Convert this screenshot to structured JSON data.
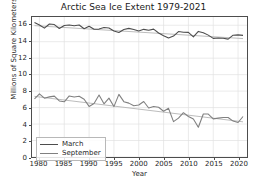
{
  "chart_data": {
    "type": "line",
    "title": "Arctic Sea Ice Extent 1979-2021",
    "xlabel": "Year",
    "ylabel": "Millions of Square Kilometers",
    "xlim": [
      1978.5,
      2021.8
    ],
    "ylim": [
      0,
      17.0
    ],
    "xticks": [
      1980,
      1985,
      1990,
      1995,
      2000,
      2005,
      2010,
      2015,
      2020
    ],
    "yticks": [
      0,
      2,
      4,
      6,
      8,
      10,
      12,
      14,
      16
    ],
    "grid": true,
    "legend_position": "lower left",
    "colors": {
      "march": "#4d4d4d",
      "september": "#808080",
      "trend": "#b3b3b3",
      "grid": "#e0e0e0",
      "axis": "#4d4d4d",
      "text": "#262626"
    },
    "x": [
      1979,
      1980,
      1981,
      1982,
      1983,
      1984,
      1985,
      1986,
      1987,
      1988,
      1989,
      1990,
      1991,
      1992,
      1993,
      1994,
      1995,
      1996,
      1997,
      1998,
      1999,
      2000,
      2001,
      2002,
      2003,
      2004,
      2005,
      2006,
      2007,
      2008,
      2009,
      2010,
      2011,
      2012,
      2013,
      2014,
      2015,
      2016,
      2017,
      2018,
      2019,
      2020,
      2021
    ],
    "series": [
      {
        "name": "March",
        "color": "#4d4d4d",
        "values": [
          16.34,
          16.03,
          15.65,
          16.15,
          16.08,
          15.6,
          15.96,
          16.03,
          15.94,
          16.03,
          15.57,
          15.88,
          15.52,
          15.53,
          15.73,
          15.66,
          15.31,
          15.12,
          15.48,
          15.62,
          15.49,
          15.29,
          15.5,
          15.39,
          15.53,
          15.06,
          14.73,
          14.45,
          14.68,
          15.23,
          15.14,
          15.13,
          14.58,
          15.25,
          15.09,
          14.8,
          14.4,
          14.45,
          14.43,
          14.31,
          14.79,
          14.83,
          14.77
        ]
      },
      {
        "name": "September",
        "color": "#808080",
        "values": [
          7.05,
          7.67,
          7.14,
          7.3,
          7.39,
          6.81,
          6.7,
          7.41,
          7.28,
          7.37,
          7.01,
          6.14,
          6.5,
          7.52,
          6.46,
          7.15,
          6.12,
          7.6,
          6.72,
          6.54,
          6.23,
          6.31,
          6.74,
          5.95,
          6.13,
          6.04,
          5.56,
          5.91,
          4.29,
          4.72,
          5.38,
          4.92,
          4.61,
          3.62,
          5.22,
          5.22,
          4.63,
          4.72,
          4.8,
          4.79,
          4.36,
          4.19,
          4.92
        ]
      }
    ],
    "trendlines": [
      {
        "name": "March trend",
        "color": "#b3b3b3",
        "x0": 1979,
        "y0": 15.95,
        "x1": 2021,
        "y1": 14.38
      },
      {
        "name": "September trend",
        "color": "#b3b3b3",
        "x0": 1979,
        "y0": 7.36,
        "x1": 2021,
        "y1": 4.27
      }
    ],
    "legend": [
      {
        "label": "March",
        "color": "#4d4d4d"
      },
      {
        "label": "September",
        "color": "#808080"
      }
    ]
  }
}
